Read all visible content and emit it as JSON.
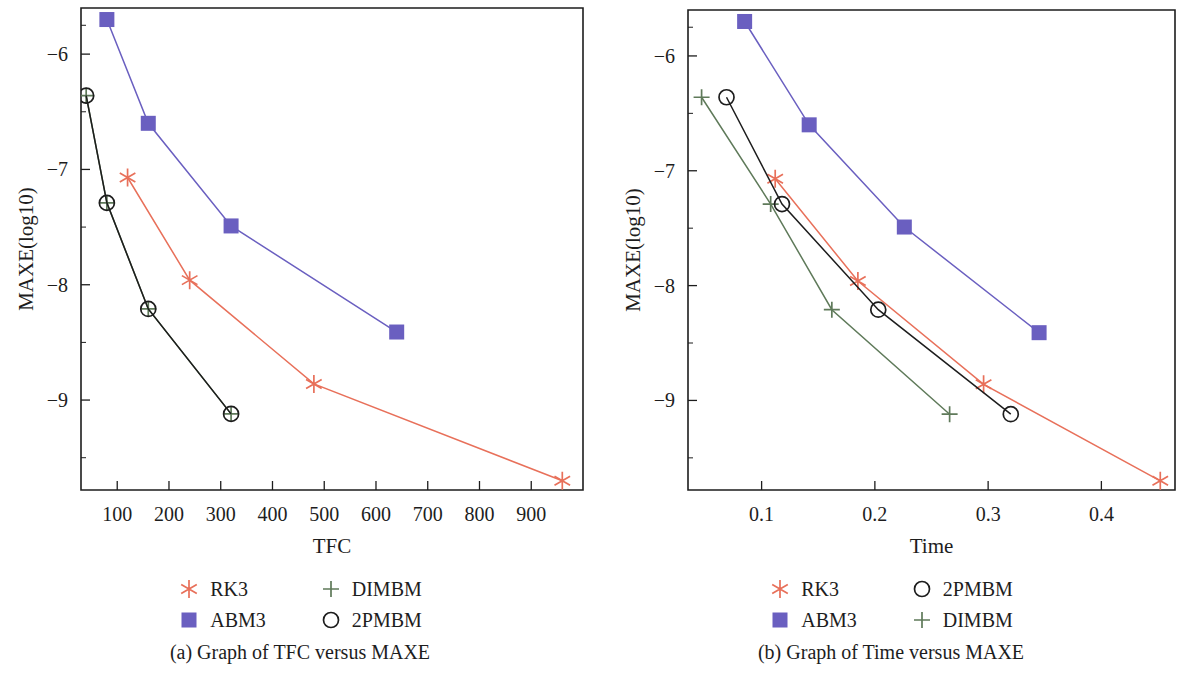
{
  "figure": {
    "panels": [
      {
        "id": "a",
        "caption": "(a)  Graph of TFC versus MAXE",
        "legend": [
          {
            "label": "RK3",
            "symbol": "star",
            "color": "#e8705a"
          },
          {
            "label": "DIMBM",
            "symbol": "plus",
            "color": "#5f7a5a"
          },
          {
            "label": "ABM3",
            "symbol": "square",
            "color": "#6a5fc0"
          },
          {
            "label": "2PMBM",
            "symbol": "circle",
            "color": "#1d1d1d"
          }
        ]
      },
      {
        "id": "b",
        "caption": "(b)  Graph of Time versus MAXE",
        "legend": [
          {
            "label": "RK3",
            "symbol": "star",
            "color": "#e8705a"
          },
          {
            "label": "2PMBM",
            "symbol": "circle",
            "color": "#1d1d1d"
          },
          {
            "label": "ABM3",
            "symbol": "square",
            "color": "#6a5fc0"
          },
          {
            "label": "DIMBM",
            "symbol": "plus",
            "color": "#5f7a5a"
          }
        ]
      }
    ]
  },
  "chart_data": [
    {
      "type": "line",
      "panel": "a",
      "title": "(a)  Graph of TFC versus MAXE",
      "xlabel": "TFC",
      "ylabel": "MAXE(log10)",
      "xlim": [
        30,
        1000
      ],
      "ylim": [
        -9.78,
        -5.6
      ],
      "xticks": [
        100,
        200,
        300,
        400,
        500,
        600,
        700,
        800,
        900
      ],
      "xtick_labels": [
        "100",
        "200",
        "300",
        "400",
        "500",
        "600",
        "700",
        "800",
        "900"
      ],
      "yticks": [
        -6,
        -7,
        -8,
        -9
      ],
      "ytick_labels": [
        "−6",
        "−7",
        "−8",
        "−9"
      ],
      "yminor": [
        -5.75,
        -6.5,
        -7.5,
        -8.5,
        -9.5
      ],
      "grid": false,
      "legend_position": "below",
      "series": [
        {
          "name": "RK3",
          "color": "#e8705a",
          "marker": "star",
          "x": [
            120,
            240,
            480,
            960
          ],
          "y": [
            -7.07,
            -7.96,
            -8.86,
            -9.7
          ]
        },
        {
          "name": "ABM3",
          "color": "#6a5fc0",
          "marker": "square",
          "x": [
            80,
            160,
            320,
            640
          ],
          "y": [
            -5.7,
            -6.6,
            -7.49,
            -8.41
          ]
        },
        {
          "name": "DIMBM",
          "color": "#5f7a5a",
          "marker": "plus",
          "x": [
            40,
            80,
            160,
            320
          ],
          "y": [
            -6.36,
            -7.29,
            -8.21,
            -9.12
          ]
        },
        {
          "name": "2PMBM",
          "color": "#1d1d1d",
          "marker": "circle",
          "x": [
            40,
            80,
            160,
            320
          ],
          "y": [
            -6.36,
            -7.29,
            -8.21,
            -9.12
          ]
        }
      ]
    },
    {
      "type": "line",
      "panel": "b",
      "title": "(b)  Graph of Time versus MAXE",
      "xlabel": "Time",
      "ylabel": "MAXE(log10)",
      "xlim": [
        0.035,
        0.465
      ],
      "ylim": [
        -9.78,
        -5.6
      ],
      "xticks": [
        0.1,
        0.2,
        0.3,
        0.4
      ],
      "xtick_labels": [
        "0.1",
        "0.2",
        "0.3",
        "0.4"
      ],
      "yticks": [
        -6,
        -7,
        -8,
        -9
      ],
      "ytick_labels": [
        "−6",
        "−7",
        "−8",
        "−9"
      ],
      "yminor": [
        -5.75,
        -6.5,
        -7.5,
        -8.5,
        -9.5
      ],
      "grid": false,
      "legend_position": "below",
      "series": [
        {
          "name": "RK3",
          "color": "#e8705a",
          "marker": "star",
          "x": [
            0.112,
            0.185,
            0.296,
            0.452
          ],
          "y": [
            -7.07,
            -7.96,
            -8.86,
            -9.7
          ]
        },
        {
          "name": "ABM3",
          "color": "#6a5fc0",
          "marker": "square",
          "x": [
            0.085,
            0.142,
            0.226,
            0.345
          ],
          "y": [
            -5.7,
            -6.6,
            -7.49,
            -8.41
          ]
        },
        {
          "name": "DIMBM",
          "color": "#5f7a5a",
          "marker": "plus",
          "x": [
            0.047,
            0.108,
            0.162,
            0.266
          ],
          "y": [
            -6.36,
            -7.29,
            -8.21,
            -9.12
          ]
        },
        {
          "name": "2PMBM",
          "color": "#1d1d1d",
          "marker": "circle",
          "x": [
            0.069,
            0.118,
            0.203,
            0.32
          ],
          "y": [
            -6.36,
            -7.29,
            -8.21,
            -9.12
          ]
        }
      ]
    }
  ]
}
